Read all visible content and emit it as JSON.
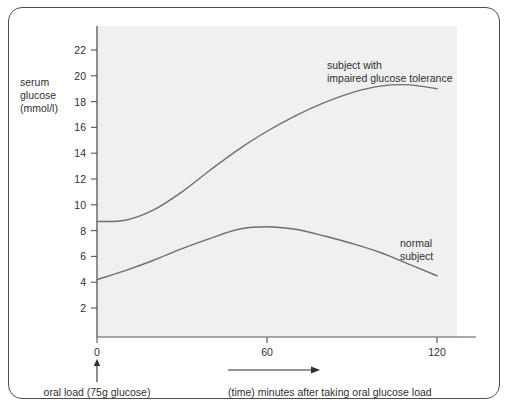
{
  "chart_data": {
    "type": "line",
    "title": "",
    "xlabel": "(time) minutes after taking oral glucose load",
    "ylabel": "serum glucose (mmol/l)",
    "ylabel_lines": [
      "serum",
      "glucose",
      "(mmol/l)"
    ],
    "xlim": [
      0,
      120
    ],
    "ylim": [
      0,
      23
    ],
    "grid": false,
    "legend_position": "inline-annotation",
    "x_ticks": [
      0,
      60,
      120
    ],
    "x_tick_labels": [
      "0",
      "60",
      "120"
    ],
    "y_ticks": [
      2,
      4,
      6,
      8,
      10,
      12,
      14,
      16,
      18,
      20,
      22
    ],
    "y_tick_labels": [
      "2",
      "4",
      "6",
      "8",
      "10",
      "12",
      "14",
      "16",
      "18",
      "20",
      "22"
    ],
    "x": [
      0,
      10,
      20,
      30,
      40,
      50,
      60,
      70,
      80,
      90,
      100,
      110,
      120
    ],
    "series": [
      {
        "name": "subject with impaired glucose tolerance",
        "label_lines": [
          "subject with",
          "impaired glucose tolerance"
        ],
        "color": "#6e6e73",
        "values": [
          8.7,
          8.8,
          9.6,
          11.0,
          12.7,
          14.3,
          15.7,
          16.9,
          17.9,
          18.7,
          19.2,
          19.3,
          19.0
        ]
      },
      {
        "name": "normal subject",
        "label_lines": [
          "normal",
          "subject"
        ],
        "color": "#6e6e73",
        "values": [
          4.2,
          4.9,
          5.7,
          6.6,
          7.4,
          8.1,
          8.3,
          8.1,
          7.6,
          7.0,
          6.3,
          5.4,
          4.5
        ]
      }
    ],
    "annotations": [
      {
        "name": "oral-load-marker",
        "text": "oral load (75g glucose)",
        "at_x": 0,
        "arrow": "up"
      },
      {
        "name": "time-axis-arrow",
        "text": "(time) minutes after taking oral glucose load",
        "arrow": "right"
      }
    ],
    "colors": {
      "plot_background": "#f0f0f0",
      "frame_border": "#4e4e52",
      "axis": "#55555a",
      "curve": "#6e6e73",
      "text": "#2f2f33"
    }
  }
}
